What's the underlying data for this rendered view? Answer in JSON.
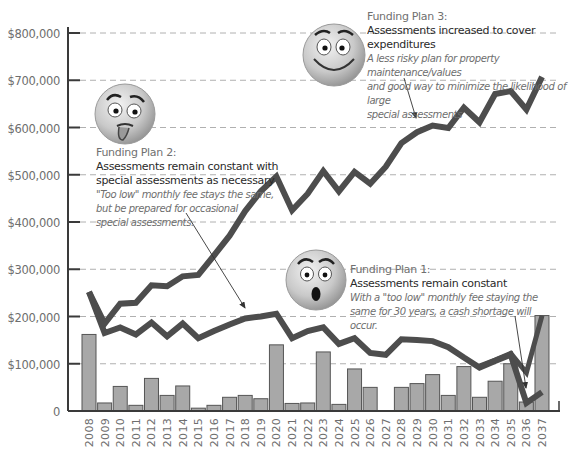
{
  "chart_data": {
    "type": "bar+line",
    "title": "",
    "xlabel": "",
    "ylabel": "",
    "ylim": [
      0,
      800000
    ],
    "yticks": [
      0,
      100000,
      200000,
      300000,
      400000,
      500000,
      600000,
      700000,
      800000
    ],
    "ytick_labels": [
      "0",
      "$100,000",
      "$200,000",
      "$300,000",
      "$400,000",
      "$500,000",
      "$600,000",
      "$700,000",
      "$800,000"
    ],
    "grid": "horizontal dashed",
    "categories": [
      "2008",
      "2009",
      "2010",
      "2011",
      "2012",
      "2013",
      "2014",
      "2015",
      "2016",
      "2017",
      "2018",
      "2019",
      "2020",
      "2021",
      "2022",
      "2023",
      "2024",
      "2025",
      "2026",
      "2027",
      "2028",
      "2029",
      "2030",
      "2031",
      "2032",
      "2033",
      "2034",
      "2035",
      "2036",
      "2037"
    ],
    "bars": {
      "name": "Special assessments / expenditures",
      "values": [
        162000,
        17000,
        52000,
        12000,
        69000,
        33000,
        53000,
        6000,
        12000,
        29000,
        33000,
        26000,
        140000,
        16000,
        17000,
        125000,
        14000,
        89000,
        50000,
        0,
        50000,
        58000,
        77000,
        33000,
        94000,
        29000,
        63000,
        100000,
        19000,
        202000
      ]
    },
    "series": [
      {
        "name": "Funding Plan 3: Assessments increased to cover expenditures",
        "values": [
          252000,
          185000,
          227000,
          229000,
          266000,
          264000,
          285000,
          288000,
          329000,
          371000,
          423000,
          465000,
          496000,
          425000,
          460000,
          508000,
          465000,
          506000,
          481000,
          517000,
          567000,
          590000,
          604000,
          599000,
          642000,
          611000,
          671000,
          677000,
          638000,
          707000
        ]
      },
      {
        "name": "Funding Plan 1: Assessments remain constant",
        "values": [
          252000,
          165000,
          177000,
          162000,
          187000,
          158000,
          185000,
          154000,
          169000,
          183000,
          196000,
          200000,
          206000,
          154000,
          169000,
          177000,
          142000,
          154000,
          123000,
          119000,
          152000,
          150000,
          148000,
          135000,
          113000,
          92000,
          106000,
          119000,
          17000,
          40000
        ]
      },
      {
        "name": "Funding Plan 2 (end segment)",
        "values": [
          null,
          null,
          null,
          null,
          null,
          null,
          null,
          null,
          null,
          null,
          null,
          null,
          null,
          null,
          null,
          null,
          null,
          null,
          null,
          null,
          null,
          null,
          null,
          null,
          null,
          95000,
          108000,
          122000,
          81000,
          202000
        ]
      }
    ],
    "annotations": [
      {
        "plan": "Funding Plan 3:",
        "headline": "Assessments increased to cover expenditures",
        "description": "A less risky plan for property maintenance/values and good way to minimize the likelihood of large special assessments",
        "face": "happy"
      },
      {
        "plan": "Funding Plan 2:",
        "headline": "Assessments remain constant with special assessments as necessary",
        "description": "\"Too low\" monthly fee stays the same, but be prepared for occasional special assessments.",
        "face": "worried-tongue"
      },
      {
        "plan": "Funding Plan 1:",
        "headline": "Assessments remain constant",
        "description": "With a \"too low\" monthly fee staying the same for 30 years, a cash shortage will occur.",
        "face": "shocked"
      }
    ],
    "colors": {
      "bar_fill": "#a8a8a8",
      "bar_stroke": "#555555",
      "line": "#4d4d4d",
      "grid": "#b0b0b0",
      "axis": "#3a3a3a",
      "tick_text": "#6e6e6e"
    }
  },
  "annotations": {
    "plan3": {
      "plan": "Funding Plan 3:",
      "headline": "Assessments increased to cover expenditures",
      "desc1": "A less risky plan for property maintenance/values",
      "desc2": "and good way to minimize the likelihood of large",
      "desc3": "special assessments"
    },
    "plan2": {
      "plan": "Funding Plan 2:",
      "head1": "Assessments remain constant with",
      "head2": "special assessments as necessary",
      "desc1": "\"Too low\" monthly fee stays the same,",
      "desc2": "but be prepared for occasional",
      "desc3": "special assessments."
    },
    "plan1": {
      "plan": "Funding Plan 1:",
      "headline": "Assessments remain constant",
      "desc1": "With a \"too low\" monthly fee staying the",
      "desc2": "same for 30 years, a cash shortage will occur."
    }
  }
}
